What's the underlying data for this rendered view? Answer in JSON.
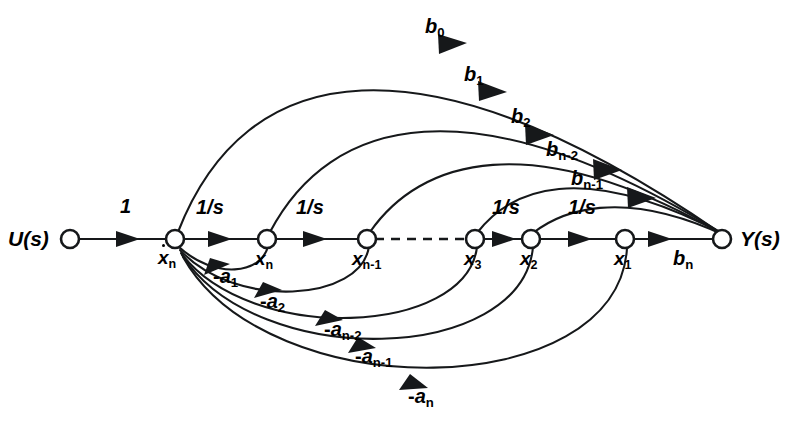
{
  "figure": {
    "kind": "signal-flow-graph",
    "width": 798,
    "height": 423,
    "background_color": "#ffffff",
    "stroke_color": "#16181a"
  },
  "io_nodes": [
    {
      "id": "U",
      "label": "U(s)",
      "x": 70,
      "y": 239,
      "role": "input-source"
    },
    {
      "id": "Y",
      "label": "Y(s)",
      "x": 722,
      "y": 239,
      "role": "output-sink"
    }
  ],
  "state_nodes": [
    {
      "id": "xndot",
      "label": "ẋn",
      "base": "x",
      "sub": "n",
      "dot": true,
      "x": 175,
      "y": 239
    },
    {
      "id": "xn",
      "label": "xn",
      "base": "x",
      "sub": "n",
      "dot": false,
      "x": 267,
      "y": 239
    },
    {
      "id": "xnm1",
      "label": "xn-1",
      "base": "x",
      "sub": "n-1",
      "dot": false,
      "x": 367,
      "y": 239
    },
    {
      "id": "x3",
      "label": "x3",
      "base": "x",
      "sub": "3",
      "dot": false,
      "x": 475,
      "y": 239
    },
    {
      "id": "x2",
      "label": "x2",
      "base": "x",
      "sub": "2",
      "dot": false,
      "x": 531,
      "y": 239
    },
    {
      "id": "x1",
      "label": "x1",
      "base": "x",
      "sub": "1",
      "dot": false,
      "x": 625,
      "y": 239
    }
  ],
  "forward_path": {
    "input_gain": {
      "label": "1",
      "from": "U",
      "to": "xndot"
    },
    "integrators": [
      {
        "label": "1/s",
        "from": "xndot",
        "to": "xn"
      },
      {
        "label": "1/s",
        "from": "xn",
        "to": "xnm1"
      },
      {
        "label": "1/s",
        "from": "x3",
        "to": "x2"
      },
      {
        "label": "1/s",
        "from": "x2",
        "to": "x1"
      }
    ],
    "ellipsis_segment": {
      "from": "xnm1",
      "to": "x3",
      "style": "dashed"
    },
    "output_gain": {
      "label": "bn",
      "base": "b",
      "sub": "n",
      "from": "x1",
      "to": "Y"
    }
  },
  "numerator_branches": [
    {
      "id": "b0",
      "base": "b",
      "sub": "0",
      "label": "b0",
      "from": "xndot",
      "to": "Y",
      "label_x": 431,
      "label_y": 22,
      "apex_y": 42
    },
    {
      "id": "b1",
      "base": "b",
      "sub": "1",
      "label": "b1",
      "from": "xn",
      "to": "Y",
      "label_x": 470,
      "label_y": 72,
      "apex_y": 88
    },
    {
      "id": "b2",
      "base": "b",
      "sub": "2",
      "label": "b2",
      "from": "xnm1",
      "to": "Y",
      "label_x": 516,
      "label_y": 114,
      "apex_y": 130
    },
    {
      "id": "bnm2",
      "base": "b",
      "sub": "n-2",
      "label": "bn-2",
      "from": "x3",
      "to": "Y",
      "label_x": 551,
      "label_y": 146,
      "apex_y": 166
    },
    {
      "id": "bnm1",
      "base": "b",
      "sub": "n-1",
      "label": "bn-1",
      "from": "x2",
      "to": "Y",
      "label_x": 576,
      "label_y": 175,
      "apex_y": 192
    }
  ],
  "feedback_branches": [
    {
      "id": "a1",
      "base": "-a",
      "sub": "1",
      "label": "-a1",
      "from": "xn",
      "to": "xndot",
      "label_x": 221,
      "label_y": 271,
      "depth_y": 275
    },
    {
      "id": "a2",
      "base": "-a",
      "sub": "2",
      "label": "-a2",
      "from": "xnm1",
      "to": "xndot",
      "label_x": 267,
      "label_y": 296,
      "depth_y": 302
    },
    {
      "id": "anm2",
      "base": "-a",
      "sub": "n-2",
      "label": "-an-2",
      "from": "x3",
      "to": "xndot",
      "label_x": 323,
      "label_y": 324,
      "depth_y": 334
    },
    {
      "id": "anm1",
      "base": "-a",
      "sub": "n-1",
      "label": "-an-1",
      "from": "x2",
      "to": "xndot",
      "label_x": 352,
      "label_y": 351,
      "depth_y": 362
    },
    {
      "id": "an",
      "base": "-a",
      "sub": "n",
      "label": "-an",
      "from": "x1",
      "to": "xndot",
      "label_x": 408,
      "label_y": 391,
      "depth_y": 402
    }
  ],
  "gain_labels": {
    "input_one": {
      "text": "1",
      "x": 124,
      "y": 206
    },
    "integrator_1": {
      "text": "1/s",
      "x": 200,
      "y": 207
    },
    "integrator_2": {
      "text": "1/s",
      "x": 300,
      "y": 207
    },
    "integrator_3": {
      "text": "1/s",
      "x": 496,
      "y": 207
    },
    "integrator_4": {
      "text": "1/s",
      "x": 572,
      "y": 207
    },
    "output_bn": {
      "x": 673,
      "y": 248
    }
  }
}
